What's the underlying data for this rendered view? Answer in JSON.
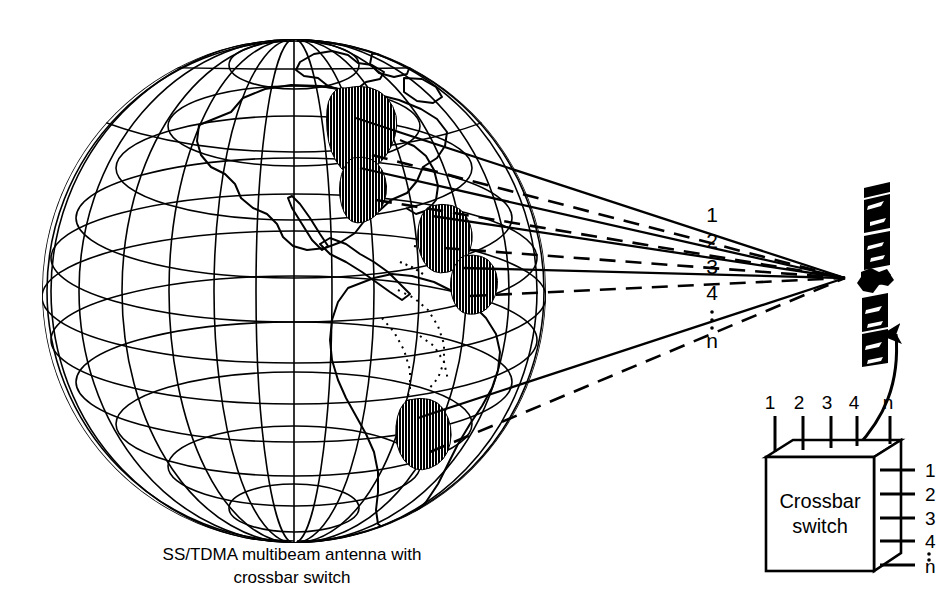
{
  "figure": {
    "title": "SS/TDMA multibeam antenna with crossbar switch",
    "caption_line_1": "SS/TDMA multibeam antenna with",
    "caption_line_2": "crossbar switch",
    "ink_color": "#000000",
    "background_color": "#ffffff"
  },
  "globe": {
    "name": "earth-globe",
    "description": "Western hemisphere globe with latitude and longitude graticule",
    "center_x": 294,
    "center_y": 291,
    "radius": 252,
    "graticule_spacing_degrees": 15,
    "continents": [
      "North America",
      "Central America",
      "South America",
      "Greenland"
    ]
  },
  "beams": {
    "labels": [
      "1",
      "2",
      "3",
      "4",
      "⋮",
      "n"
    ],
    "count_label": "n",
    "items": [
      {
        "label": "1",
        "footprint": "North America northeast"
      },
      {
        "label": "2",
        "footprint": "North America midwest"
      },
      {
        "label": "3",
        "footprint": "United States southeast"
      },
      {
        "label": "4",
        "footprint": "Caribbean / Gulf"
      },
      {
        "label": "n",
        "footprint": "South America southeast"
      }
    ]
  },
  "satellite": {
    "name": "satellite",
    "description": "Geostationary satellite with solar array panels"
  },
  "crossbar": {
    "title_line_1": "Crossbar",
    "title_line_2": "switch",
    "input_labels": [
      "1",
      "2",
      "3",
      "4",
      "n"
    ],
    "output_labels": [
      "1",
      "2",
      "3",
      "4",
      "⋮",
      "n"
    ]
  }
}
